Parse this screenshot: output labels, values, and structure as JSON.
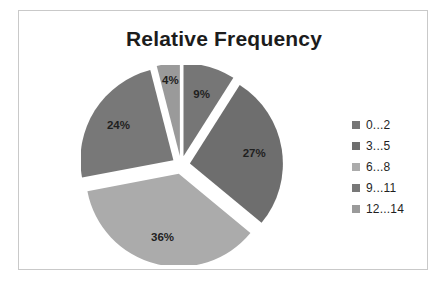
{
  "frame": {
    "border_color": "#c9c9c9",
    "background": "#ffffff"
  },
  "chart_data": {
    "type": "pie",
    "title": "Relative Frequency",
    "subtitle": "",
    "xlabel": "",
    "ylabel": "",
    "exploded": true,
    "start_angle_deg": 0,
    "direction": "clockwise",
    "legend_position": "right",
    "grid": false,
    "categories": [
      "0...2",
      "3...5",
      "6...8",
      "9...11",
      "12...14"
    ],
    "values": [
      9,
      27,
      36,
      24,
      4
    ],
    "value_labels": [
      "9%",
      "27%",
      "36%",
      "24%",
      "4%"
    ],
    "value_unit": "%",
    "total": 100,
    "colors": [
      "#767676",
      "#6e6e6e",
      "#ababab",
      "#787878",
      "#9a9a9a"
    ],
    "slices": [
      {
        "label": "0...2",
        "value": 9,
        "value_label": "9%",
        "color": "#767676"
      },
      {
        "label": "3...5",
        "value": 27,
        "value_label": "27%",
        "color": "#6e6e6e"
      },
      {
        "label": "6...8",
        "value": 36,
        "value_label": "36%",
        "color": "#ababab"
      },
      {
        "label": "9...11",
        "value": 24,
        "value_label": "24%",
        "color": "#787878"
      },
      {
        "label": "12...14",
        "value": 4,
        "value_label": "4%",
        "color": "#9a9a9a"
      }
    ]
  },
  "legend": {
    "items": [
      {
        "label": "0...2",
        "color": "#767676"
      },
      {
        "label": "3...5",
        "color": "#6e6e6e"
      },
      {
        "label": "6...8",
        "color": "#ababab"
      },
      {
        "label": "9...11",
        "color": "#787878"
      },
      {
        "label": "12...14",
        "color": "#9a9a9a"
      }
    ]
  }
}
